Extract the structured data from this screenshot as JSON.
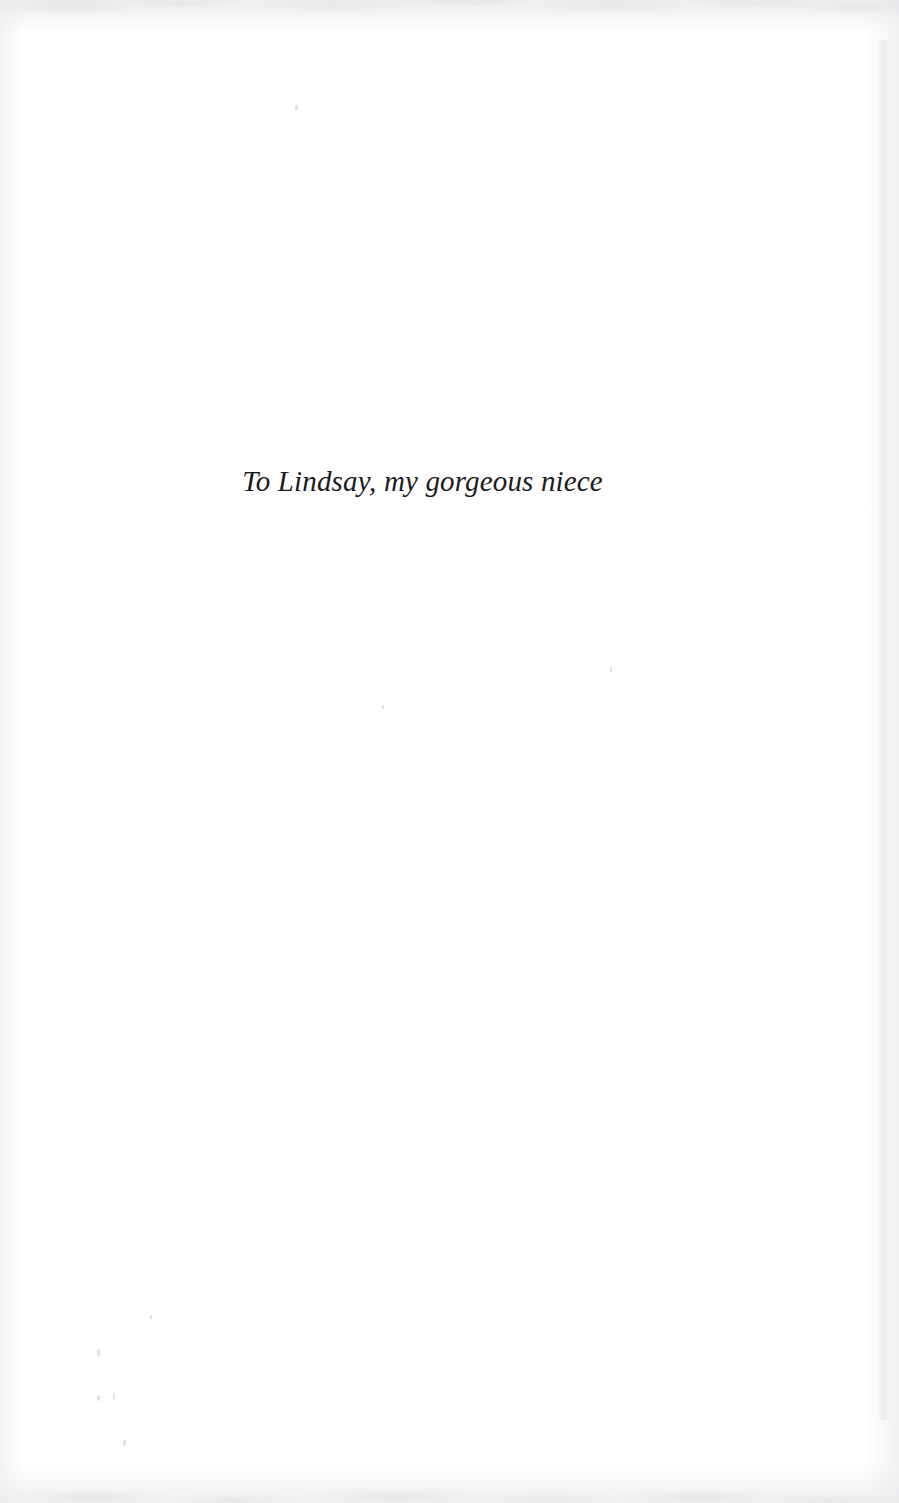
{
  "page": {
    "kind": "book-dedication-page",
    "background_color": "#ffffff",
    "width": 899,
    "height": 1503
  },
  "dedication": {
    "text": "To Lindsay, my gorgeous niece",
    "style": "italic-serif",
    "color": "#1b1b1d",
    "alignment": "centered"
  },
  "artifacts": {
    "top_edge_label": "scan-edge-top",
    "bottom_edge_label": "scan-edge-bottom",
    "left_edge_label": "scan-edge-left",
    "right_edge_label": "scan-edge-right",
    "specks": [
      {
        "x": 295,
        "y": 105,
        "w": 3,
        "h": 5
      },
      {
        "x": 97,
        "y": 1349,
        "w": 3,
        "h": 7
      },
      {
        "x": 97,
        "y": 1395,
        "w": 3,
        "h": 6
      },
      {
        "x": 113,
        "y": 1393,
        "w": 2,
        "h": 7
      },
      {
        "x": 123,
        "y": 1440,
        "w": 3,
        "h": 6
      },
      {
        "x": 150,
        "y": 1315,
        "w": 2,
        "h": 4
      },
      {
        "x": 382,
        "y": 705,
        "w": 2,
        "h": 4
      },
      {
        "x": 610,
        "y": 667,
        "w": 2,
        "h": 5
      }
    ]
  }
}
